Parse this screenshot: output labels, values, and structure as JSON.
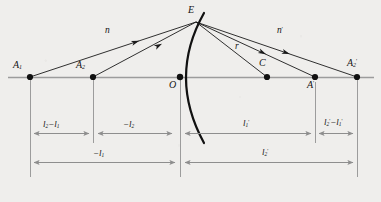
{
  "figure": {
    "type": "optics-ray-diagram",
    "background_color": "#efeeec",
    "line_color": "#1a1a1a",
    "axis_color": "#9a9a9a",
    "dim_color": "#8e8e8e"
  },
  "points": [
    {
      "id": "A1",
      "label": "A",
      "sub": "1",
      "prime": "",
      "x": 30,
      "y": 77,
      "label_x": 13,
      "label_y": 62
    },
    {
      "id": "A2",
      "label": "A",
      "sub": "2",
      "prime": "",
      "x": 93,
      "y": 77,
      "label_x": 78,
      "label_y": 62
    },
    {
      "id": "O",
      "label": "O",
      "sub": "",
      "prime": "",
      "x": 180,
      "y": 77,
      "label_x": 168,
      "label_y": 80
    },
    {
      "id": "C",
      "label": "C",
      "sub": "",
      "prime": "",
      "x": 267,
      "y": 77,
      "label_x": 259,
      "label_y": 60
    },
    {
      "id": "Ap",
      "label": "A",
      "sub": "",
      "prime": "'",
      "x": 315,
      "y": 77,
      "label_x": 308,
      "label_y": 80
    },
    {
      "id": "A2p",
      "label": "A",
      "sub": "2",
      "prime": "'",
      "x": 357,
      "y": 77,
      "label_x": 349,
      "label_y": 60
    },
    {
      "id": "E",
      "label": "E",
      "sub": "",
      "prime": "",
      "x": 196,
      "y": 22,
      "label_x": 188,
      "label_y": 6
    }
  ],
  "rays": [
    {
      "id": "incident-1",
      "from": "A1",
      "to": "E",
      "label": "n",
      "label_x": 106,
      "label_y": 28,
      "arrow_at": 0.6
    },
    {
      "id": "incident-2",
      "from": "A2",
      "to": "E",
      "label": "n",
      "label_x": 0,
      "label_y": 0,
      "arrow_at": 0.62
    },
    {
      "id": "radius",
      "from": "E",
      "to": "C",
      "label": "r",
      "label_x": 236,
      "label_y": 44,
      "arrow_at": 0
    },
    {
      "id": "refracted-1",
      "from": "E",
      "to": "A2p",
      "label": "n'",
      "label_x": 278,
      "label_y": 28,
      "arrow_at": 0.56
    },
    {
      "id": "refracted-2",
      "from": "E",
      "to": "Ap",
      "label": "",
      "label_x": 0,
      "label_y": 0,
      "arrow_at": 0.5
    }
  ],
  "ray_labels": {
    "incident_index": "n",
    "refracted_index": "n'",
    "radius": "r"
  },
  "dimensions": [
    {
      "id": "dim-l2-minus-l1",
      "label_main": "l",
      "label_sub": "2",
      "label_prime": "",
      "label_tail_op": "−",
      "label_tail_main": "l",
      "label_tail_sub": "1",
      "label_tail_prime": "",
      "text": "l₂−l₁",
      "x1": 30,
      "x2": 93,
      "y": 133,
      "label_x": 44,
      "label_y": 121
    },
    {
      "id": "dim-minus-l2",
      "label_main": "−l",
      "label_sub": "2",
      "label_prime": "",
      "label_tail_op": "",
      "label_tail_main": "",
      "label_tail_sub": "",
      "label_tail_prime": "",
      "text": "−l₂",
      "x1": 93,
      "x2": 176,
      "y": 133,
      "label_x": 126,
      "label_y": 121
    },
    {
      "id": "dim-l1-prime",
      "label_main": "l",
      "label_sub": "1",
      "label_prime": "'",
      "label_tail_op": "",
      "label_tail_main": "",
      "label_tail_sub": "",
      "label_tail_prime": "",
      "text": "l₁'",
      "x1": 184,
      "x2": 315,
      "y": 133,
      "label_x": 244,
      "label_y": 121
    },
    {
      "id": "dim-l2p-minus-l1p",
      "label_main": "l",
      "label_sub": "2",
      "label_prime": "'",
      "label_tail_op": "−",
      "label_tail_main": "l",
      "label_tail_sub": "1",
      "label_tail_prime": "'",
      "text": "l₂'−l₁'",
      "x1": 315,
      "x2": 357,
      "y": 133,
      "label_x": 326,
      "label_y": 120
    },
    {
      "id": "dim-minus-l1",
      "label_main": "−l",
      "label_sub": "1",
      "label_prime": "",
      "label_tail_op": "",
      "label_tail_main": "",
      "label_tail_sub": "",
      "label_tail_prime": "",
      "text": "−l₁",
      "x1": 30,
      "x2": 178,
      "y": 162,
      "label_x": 96,
      "label_y": 150
    },
    {
      "id": "dim-l2-prime",
      "label_main": "l",
      "label_sub": "2",
      "label_prime": "'",
      "label_tail_op": "",
      "label_tail_main": "",
      "label_tail_sub": "",
      "label_tail_prime": "",
      "text": "l₂'",
      "x1": 182,
      "x2": 357,
      "y": 162,
      "label_x": 264,
      "label_y": 150
    }
  ],
  "guides": [
    {
      "id": "guide-A1",
      "x": 30,
      "y1": 77,
      "y2": 177
    },
    {
      "id": "guide-A2",
      "x": 93,
      "y1": 77,
      "y2": 143
    },
    {
      "id": "guide-O",
      "x": 180,
      "y1": 77,
      "y2": 177
    },
    {
      "id": "guide-Ap",
      "x": 315,
      "y1": 82,
      "y2": 143
    },
    {
      "id": "guide-A2p",
      "x": 357,
      "y1": 77,
      "y2": 177
    }
  ],
  "axis": {
    "id": "optical-axis",
    "x1": 8,
    "x2": 374,
    "y": 77
  },
  "surface": {
    "id": "refracting-surface",
    "vertex_x": 180,
    "vertex_y": 77,
    "top_x": 204,
    "top_y": 13,
    "bottom_x": 204,
    "bottom_y": 143
  }
}
